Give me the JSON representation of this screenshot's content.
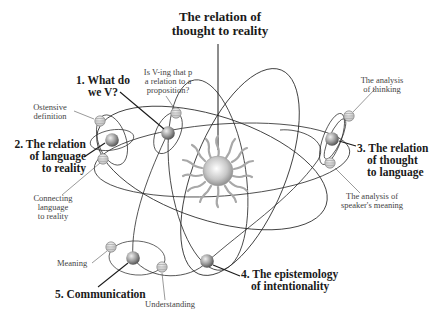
{
  "title": {
    "line1": "The relation of",
    "line2": "thought to reality"
  },
  "center": {
    "icon": "sun-icon",
    "label_ref": "title"
  },
  "planets": [
    {
      "id": 1,
      "label": [
        "1. What do",
        "we V?"
      ]
    },
    {
      "id": 2,
      "label": [
        "2. The relation",
        "of language",
        "to reality"
      ]
    },
    {
      "id": 3,
      "label": [
        "3. The relation",
        "of thought",
        "to language"
      ]
    },
    {
      "id": 4,
      "label": [
        "4. The epistemology",
        "of intentionality"
      ]
    },
    {
      "id": 5,
      "label": [
        "5. Communication"
      ]
    }
  ],
  "moons": [
    {
      "planet": 1,
      "label": [
        "Is V-ing that p",
        "a relation to a",
        "proposition?"
      ]
    },
    {
      "planet": 2,
      "label": [
        "Ostensive",
        "definition"
      ]
    },
    {
      "planet": 2,
      "label": [
        "Connecting",
        "language",
        "to reality"
      ]
    },
    {
      "planet": 3,
      "label": [
        "The analysis",
        "of  thinking"
      ]
    },
    {
      "planet": 3,
      "label": [
        "The analysis of",
        "speaker's meaning"
      ]
    },
    {
      "planet": 5,
      "label": [
        "Meaning"
      ]
    },
    {
      "planet": 5,
      "label": [
        "Understanding"
      ]
    }
  ],
  "colors": {
    "line": "#2a2a2a",
    "planet_light": "#e8e8e8",
    "planet_dark": "#5a5a5a",
    "sun_light": "#f2f2f2",
    "sun_dark": "#8a8a8a",
    "ray": "#a8a8a8"
  }
}
